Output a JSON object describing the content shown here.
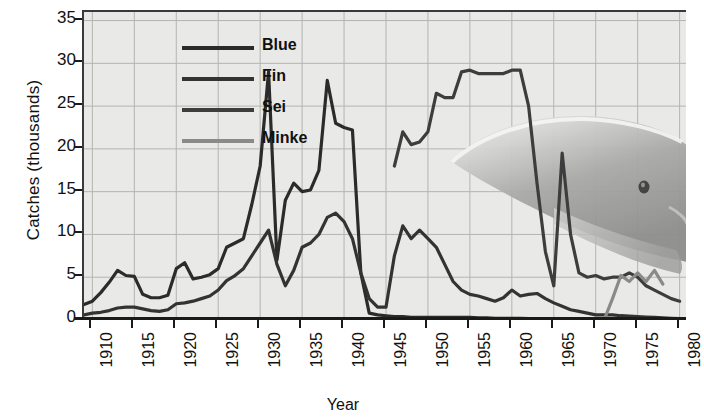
{
  "chart_data": {
    "type": "line",
    "title": "",
    "xlabel": "Year",
    "ylabel": "Catches (thousands)",
    "xlim": [
      1909,
      1981
    ],
    "ylim": [
      0,
      36
    ],
    "xticks": [
      "1910",
      "1915",
      "1920",
      "1925",
      "1930",
      "1935",
      "1940",
      "1945",
      "1950",
      "1955",
      "1960",
      "1965",
      "1970",
      "1975",
      "1980"
    ],
    "yticks": [
      "0",
      "5",
      "10",
      "15",
      "20",
      "25",
      "30",
      "35"
    ],
    "grid": true,
    "legend_position": "top-left",
    "background_image": "whale-watermark",
    "series": [
      {
        "name": "Blue",
        "color": "#2b2b2b",
        "x": [
          1909,
          1910,
          1911,
          1912,
          1913,
          1914,
          1915,
          1916,
          1917,
          1918,
          1919,
          1920,
          1921,
          1922,
          1923,
          1924,
          1925,
          1926,
          1927,
          1928,
          1929,
          1930,
          1931,
          1932,
          1933,
          1934,
          1935,
          1936,
          1937,
          1938,
          1939,
          1940,
          1941,
          1942,
          1943,
          1944,
          1945,
          1946,
          1947,
          1948,
          1949,
          1950,
          1951,
          1952,
          1953,
          1954,
          1955,
          1956,
          1957,
          1958,
          1959,
          1960,
          1961,
          1962,
          1963,
          1964,
          1965,
          1966,
          1967,
          1968
        ],
        "values": [
          1.8,
          2.2,
          3.2,
          4.4,
          5.8,
          5.2,
          5.1,
          3.0,
          2.6,
          2.6,
          2.9,
          6.0,
          6.7,
          4.8,
          5.0,
          5.3,
          6.0,
          8.5,
          9.0,
          9.5,
          13.5,
          18.0,
          29.0,
          7.0,
          14.0,
          16.0,
          15.0,
          15.2,
          17.5,
          28.0,
          23.0,
          22.5,
          22.2,
          5.5,
          0.8,
          0.6,
          0.5,
          0.4,
          0.4,
          0.3,
          0.3,
          0.3,
          0.3,
          0.3,
          0.3,
          0.3,
          0.3,
          0.25,
          0.25,
          0.2,
          0.2,
          0.2,
          0.2,
          0.15,
          0.15,
          0.1,
          0.1,
          0.05,
          0.05,
          0.0
        ]
      },
      {
        "name": "Fin",
        "color": "#333333",
        "x": [
          1909,
          1910,
          1911,
          1912,
          1913,
          1914,
          1915,
          1916,
          1917,
          1918,
          1919,
          1920,
          1921,
          1922,
          1923,
          1924,
          1925,
          1926,
          1927,
          1928,
          1929,
          1930,
          1931,
          1932,
          1933,
          1934,
          1935,
          1936,
          1937,
          1938,
          1939,
          1940,
          1941,
          1942,
          1943,
          1944,
          1945,
          1946,
          1947,
          1948,
          1949,
          1950,
          1951,
          1952,
          1953,
          1954,
          1955,
          1956,
          1957,
          1958,
          1959,
          1960,
          1961,
          1962,
          1963,
          1964,
          1965,
          1966,
          1967,
          1968,
          1969,
          1970,
          1971,
          1972,
          1973,
          1974,
          1975,
          1976,
          1977,
          1978,
          1979,
          1980
        ],
        "values": [
          0.6,
          0.8,
          0.9,
          1.1,
          1.4,
          1.5,
          1.5,
          1.3,
          1.1,
          1.0,
          1.2,
          1.9,
          2.0,
          2.2,
          2.5,
          2.8,
          3.5,
          4.6,
          5.2,
          6.0,
          7.5,
          9.0,
          10.5,
          6.5,
          4.0,
          5.8,
          8.5,
          9.0,
          10.0,
          12.0,
          12.5,
          11.5,
          9.5,
          5.5,
          2.5,
          1.5,
          1.5,
          7.5,
          11.0,
          9.5,
          10.5,
          9.5,
          8.5,
          6.5,
          4.5,
          3.5,
          3.0,
          2.8,
          2.5,
          2.2,
          2.6,
          3.5,
          2.8,
          3.0,
          3.1,
          2.5,
          2.0,
          1.6,
          1.2,
          1.0,
          0.8,
          0.6,
          0.6,
          0.6,
          0.5,
          0.45,
          0.4,
          0.35,
          0.3,
          0.25,
          0.2,
          0.15
        ]
      },
      {
        "name": "Sei",
        "color": "#3d3d3d",
        "x": [
          1946,
          1947,
          1948,
          1949,
          1950,
          1951,
          1952,
          1953,
          1954,
          1955,
          1956,
          1957,
          1958,
          1959,
          1960,
          1961,
          1962,
          1963,
          1964,
          1965,
          1966,
          1967,
          1968,
          1969,
          1970,
          1971,
          1972,
          1973,
          1974,
          1975,
          1976,
          1977,
          1978,
          1979,
          1980
        ],
        "values": [
          18.0,
          22.0,
          20.5,
          20.8,
          22.0,
          26.5,
          26.0,
          26.0,
          29.0,
          29.2,
          28.8,
          28.8,
          28.8,
          28.8,
          29.2,
          29.2,
          25.0,
          16.0,
          8.0,
          4.0,
          19.5,
          10.0,
          5.5,
          5.0,
          5.2,
          4.8,
          5.0,
          5.0,
          5.5,
          5.0,
          4.0,
          3.5,
          3.0,
          2.5,
          2.2
        ]
      },
      {
        "name": "Minke",
        "color": "#8a8a8a",
        "x": [
          1971,
          1972,
          1973,
          1974,
          1975,
          1976,
          1977,
          1978
        ],
        "values": [
          0.0,
          2.5,
          5.2,
          4.5,
          5.5,
          4.5,
          5.8,
          4.2
        ]
      }
    ]
  },
  "legend": {
    "items": [
      {
        "label": "Blue",
        "color": "#2b2b2b"
      },
      {
        "label": "Fin",
        "color": "#333333"
      },
      {
        "label": "Sei",
        "color": "#3d3d3d"
      },
      {
        "label": "Minke",
        "color": "#8a8a8a"
      }
    ]
  },
  "axis": {
    "y_title": "Catches (thousands)",
    "x_title": "Year"
  }
}
